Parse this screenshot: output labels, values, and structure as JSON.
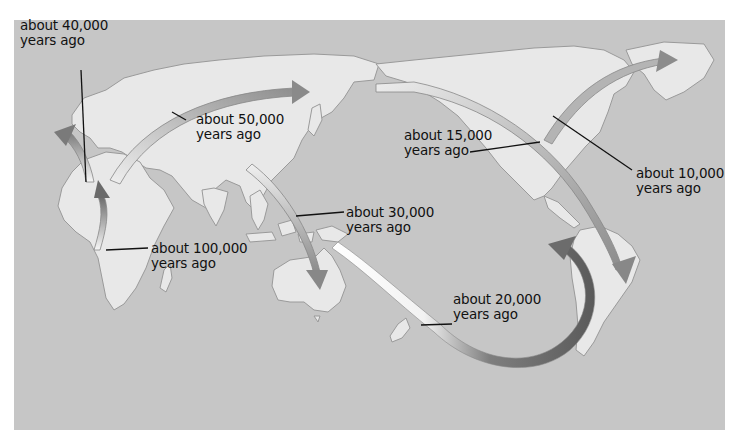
{
  "map": {
    "title": "Human migration routes",
    "colors": {
      "ocean": "#c6c6c6",
      "land": "#e8e8e8",
      "coast": "#9a9a9a",
      "arrow_dark": "#6e6e6e",
      "arrow_light": "#f4f4f4",
      "text": "#111111"
    }
  },
  "labels": [
    {
      "id": "40k",
      "line1": "about 40,000",
      "line2": "years ago"
    },
    {
      "id": "50k",
      "line1": "about 50,000",
      "line2": "years ago"
    },
    {
      "id": "15k",
      "line1": "about 15,000",
      "line2": "years ago"
    },
    {
      "id": "10k",
      "line1": "about 10,000",
      "line2": "years ago"
    },
    {
      "id": "30k",
      "line1": "about 30,000",
      "line2": "years ago"
    },
    {
      "id": "100k",
      "line1": "about 100,000",
      "line2": "years ago"
    },
    {
      "id": "20k",
      "line1": "about 20,000",
      "line2": "years ago"
    }
  ]
}
